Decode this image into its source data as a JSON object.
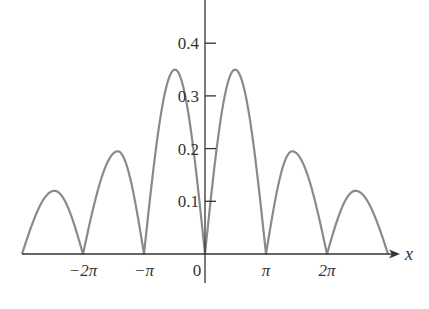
{
  "chart_data": {
    "type": "line",
    "title": "",
    "xlabel": "x",
    "ylabel": "",
    "x_ticks": [
      {
        "label": "−2π",
        "value": -6.2832
      },
      {
        "label": "−π",
        "value": -3.1416
      },
      {
        "label": "0",
        "value": 0
      },
      {
        "label": "π",
        "value": 3.1416
      },
      {
        "label": "2π",
        "value": 6.2832
      }
    ],
    "y_ticks": [
      {
        "label": "0.1",
        "value": 0.1
      },
      {
        "label": "0.2",
        "value": 0.2
      },
      {
        "label": "0.3",
        "value": 0.3
      },
      {
        "label": "0.4",
        "value": 0.4
      }
    ],
    "xlim": [
      -9.4248,
      9.4248
    ],
    "ylim": [
      0,
      0.48
    ],
    "grid": false,
    "legend": null,
    "series": [
      {
        "name": "f(x)",
        "color": "#8a8a8a",
        "zeros": [
          -9.4248,
          -6.2832,
          -3.1416,
          0,
          3.1416,
          6.2832,
          9.4248
        ],
        "peaks": [
          {
            "x": -7.75,
            "y": 0.12
          },
          {
            "x": -4.49,
            "y": 0.195
          },
          {
            "x": -1.55,
            "y": 0.35
          },
          {
            "x": 1.55,
            "y": 0.35
          },
          {
            "x": 4.49,
            "y": 0.195
          },
          {
            "x": 7.75,
            "y": 0.12
          }
        ]
      }
    ]
  }
}
